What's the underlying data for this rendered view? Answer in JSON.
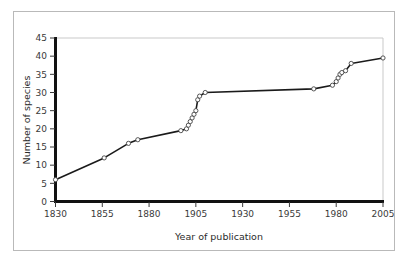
{
  "figure": {
    "background_color": "#ffffff",
    "border_color": "#b9b9b9"
  },
  "chart_data": {
    "type": "line",
    "title": "",
    "subtitle": "",
    "xlabel": "Year of publication",
    "ylabel": "Number of species",
    "xlim": [
      1830,
      2005
    ],
    "ylim": [
      0,
      45
    ],
    "xticks": [
      1830,
      1855,
      1880,
      1905,
      1930,
      1955,
      1980,
      2005
    ],
    "xtick_labels": [
      "1830",
      "1855",
      "1880",
      "1905",
      "1930",
      "1955",
      "1980",
      "2005"
    ],
    "yticks": [
      0,
      5,
      10,
      15,
      20,
      25,
      30,
      35,
      40,
      45
    ],
    "ytick_labels": [
      "0",
      "5",
      "10",
      "15",
      "20",
      "25",
      "30",
      "35",
      "40",
      "45"
    ],
    "grid": false,
    "legend": null,
    "legend_position": "none",
    "line_color": "#1a1a1a",
    "marker_shape": "open-circle",
    "marker_face_color": "#ffffff",
    "marker_edge_color": "#444444",
    "annotations": [],
    "series": [
      {
        "name": "Cumulative number of species described",
        "x": [
          1830,
          1856,
          1869,
          1874,
          1897,
          1900,
          1901,
          1902,
          1903,
          1904,
          1905,
          1906,
          1907,
          1910,
          1968,
          1978,
          1980,
          1981,
          1982,
          1983,
          1985,
          1988,
          2005
        ],
        "y": [
          6,
          12,
          16,
          17,
          19.5,
          20,
          21,
          22,
          23,
          24,
          25,
          28,
          29,
          30,
          31,
          32,
          33,
          34,
          35,
          35.5,
          36,
          38,
          39.5
        ]
      }
    ]
  },
  "axis_labels": {
    "x_title": "Year of publication",
    "y_title": "Number of species"
  }
}
